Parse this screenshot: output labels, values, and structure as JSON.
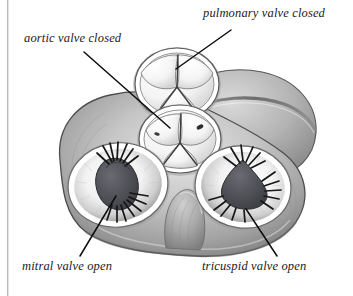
{
  "figure": {
    "kind": "anatomical-diagram",
    "background_color": "#ffffff",
    "labels": [
      {
        "id": "pulmonary",
        "text": "pulmonary valve closed",
        "name": "label-pulmonary-valve",
        "leader": {
          "x1": 231,
          "y1": 30,
          "x2": 176,
          "y2": 69
        }
      },
      {
        "id": "aortic",
        "text": "aortic valve closed",
        "name": "label-aortic-valve",
        "leader": {
          "x1": 84,
          "y1": 52,
          "x2": 170,
          "y2": 128
        }
      },
      {
        "id": "mitral",
        "text": "mitral valve open",
        "name": "label-mitral-valve",
        "leader": {
          "x1": 116,
          "y1": 196,
          "x2": 80,
          "y2": 256
        }
      },
      {
        "id": "tricuspid",
        "text": "tricuspid valve open",
        "name": "label-tricuspid-valve",
        "leader": {
          "x1": 246,
          "y1": 209,
          "x2": 277,
          "y2": 256
        }
      }
    ],
    "structures": [
      {
        "id": "myocardium",
        "name": "myocardium-mass",
        "description": "outer heart muscle mass, gray shaded"
      },
      {
        "id": "coronary-sulcus",
        "name": "coronary-sulcus-groove",
        "description": "dark groove across upper right lobe"
      },
      {
        "id": "pulmonary-valve",
        "name": "pulmonary-valve",
        "description": "three closed semilunar cusps, Y junction"
      },
      {
        "id": "aortic-valve",
        "name": "aortic-valve",
        "description": "three closed semilunar cusps with coronary ostia"
      },
      {
        "id": "mitral-valve",
        "name": "mitral-valve",
        "description": "open oval orifice with chordae tendineae"
      },
      {
        "id": "tricuspid-valve",
        "name": "tricuspid-valve",
        "description": "open trilobed orifice with chordae tendineae"
      },
      {
        "id": "fibrous-body",
        "name": "central-fibrous-body",
        "description": "bump between the two atrioventricular valves"
      }
    ],
    "colors": {
      "outline": "#3a3a3a",
      "muscle_light": "#d8d8d8",
      "muscle_mid": "#a9a9a9",
      "muscle_dark": "#6f6f6f",
      "sulcus": "#5d5d5d",
      "cusp_light": "#fbfbfb",
      "cusp_shade": "#c9c9c9",
      "orifice_dark": "#4a4a50",
      "chordae": "#1d1d1d",
      "leader_line": "#0d0d0d",
      "label_text": "#1a1a1a",
      "scan_edge": "#b9b9b9"
    }
  }
}
